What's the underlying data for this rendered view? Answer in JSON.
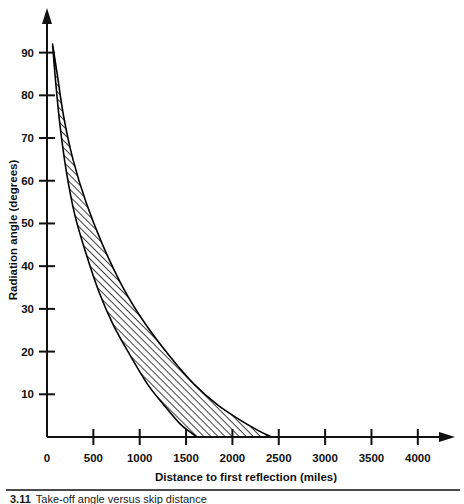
{
  "figure": {
    "caption_number": "3.11",
    "caption_text": "Take-off angle versus skip distance"
  },
  "chart_data": {
    "type": "area",
    "title": "",
    "xlabel": "Distance to first reflection (miles)",
    "ylabel": "Radiation angle (degrees)",
    "xlim": [
      0,
      4250
    ],
    "ylim": [
      0,
      96
    ],
    "grid": false,
    "legend": "none",
    "xticks": [
      0,
      500,
      1000,
      1500,
      2000,
      2500,
      3000,
      3500,
      4000
    ],
    "xtick_labels": [
      "0",
      "500",
      "1000",
      "1500",
      "2000",
      "2500",
      "3000",
      "3500",
      "4000"
    ],
    "yticks": [
      10,
      20,
      30,
      40,
      50,
      60,
      70,
      80,
      90
    ],
    "ytick_labels": [
      "10",
      "20",
      "30",
      "40",
      "50",
      "60",
      "70",
      "80",
      "90"
    ],
    "band_fill": "hatch-diagonal",
    "band_edge_color": "#000000",
    "series": [
      {
        "name": "lower-bound",
        "x": [
          60,
          90,
          140,
          210,
          300,
          420,
          560,
          720,
          900,
          1080,
          1260,
          1430,
          1560,
          1620
        ],
        "values": [
          92,
          84,
          73,
          62,
          52,
          43,
          34,
          26,
          19,
          12.5,
          7.5,
          3.2,
          0.9,
          0
        ]
      },
      {
        "name": "upper-bound",
        "x": [
          60,
          110,
          180,
          280,
          420,
          600,
          820,
          1060,
          1320,
          1580,
          1840,
          2080,
          2280,
          2420
        ],
        "values": [
          92,
          85,
          75,
          65,
          55,
          45,
          35,
          26.5,
          19,
          12.5,
          7.5,
          4,
          1.5,
          0
        ]
      }
    ]
  }
}
